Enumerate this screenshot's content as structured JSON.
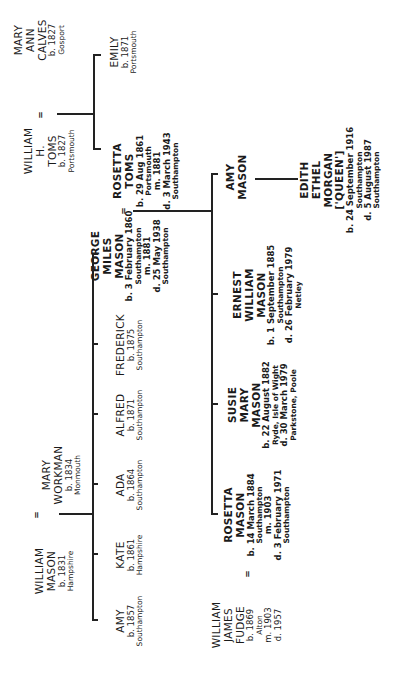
{
  "marriage_symbol": "=",
  "generation1": {
    "william_toms": {
      "name": [
        "WILLIAM",
        "H.",
        "TOMS"
      ],
      "details": [
        "b. 1827",
        "Portsmouth"
      ]
    },
    "mary_ann_calves": {
      "name": [
        "MARY",
        "ANN",
        "CALVES"
      ],
      "details": [
        "b. 1827",
        "Gosport"
      ]
    },
    "william_mason": {
      "name": [
        "WILLIAM",
        "MASON"
      ],
      "details": [
        "b. 1831",
        "Hampshire"
      ]
    },
    "mary_workman": {
      "name": [
        "MARY",
        "WORKMAN"
      ],
      "details": [
        "b. 1834",
        "Monmouth"
      ]
    }
  },
  "generation2": {
    "rosetta_toms": {
      "name": [
        "ROSETTA",
        "TOMS"
      ],
      "details": [
        "b. 29 Aug 1861",
        "Portsmouth",
        "m. 1881",
        "d. 3 March 1943",
        "Southampton"
      ]
    },
    "emily": {
      "name": [
        "EMILY"
      ],
      "details": [
        "b. 1871",
        "Portsmouth"
      ]
    },
    "george_miles_mason": {
      "name": [
        "GEORGE",
        "MILES",
        "MASON"
      ],
      "details": [
        "b. 3 February 1860",
        "Southampton",
        "m. 1881",
        "d. 25 May 1938",
        "Southampton"
      ]
    },
    "frederick": {
      "name": [
        "FREDERICK"
      ],
      "details": [
        "b. 1875",
        "Southampton"
      ]
    },
    "alfred": {
      "name": [
        "ALFRED"
      ],
      "details": [
        "b. 1871",
        "Southampton"
      ]
    },
    "ada": {
      "name": [
        "ADA"
      ],
      "details": [
        "b. 1864",
        "Southampton"
      ]
    },
    "kate": {
      "name": [
        "KATE"
      ],
      "details": [
        "b. 1861",
        "Hampshire"
      ]
    },
    "amy": {
      "name": [
        "AMY"
      ],
      "details": [
        "b. 1857",
        "Southampton"
      ]
    }
  },
  "generation3": {
    "amy_mason": {
      "name": [
        "AMY",
        "MASON"
      ],
      "details": []
    },
    "ernest_william_mason": {
      "name": [
        "ERNEST",
        "WILLIAM",
        "MASON"
      ],
      "details": [
        "b. 1 September 1885",
        "Southampton",
        "d. 26 February 1979",
        "Netley"
      ]
    },
    "susie_mary_mason": {
      "name": [
        "SUSIE",
        "MARY",
        "MASON"
      ],
      "details": [
        "b. 22 August 1882",
        "Ryde, Isle of Wight",
        "d. 30 March 1979",
        "Parkstone, Poole"
      ]
    },
    "rosetta_mason": {
      "name": [
        "ROSETTA",
        "MASON"
      ],
      "details": [
        "b. 14 March 1884",
        "Southampton",
        "m. 1903",
        "d. 3 February 1971",
        "Southampton"
      ]
    },
    "william_james_fudge": {
      "name": [
        "WILLIAM",
        "JAMES",
        "FUDGE"
      ],
      "details": [
        "b. 1869",
        "Alton",
        "m. 1903",
        "d. 1957"
      ]
    }
  },
  "generation4": {
    "edith_ethel_morgan": {
      "name": [
        "EDITH",
        "ETHEL",
        "MORGAN",
        "['QUEEN']"
      ],
      "details": [
        "b. 24 September 1916",
        "Southampton",
        "d. 5 August 1987",
        "Southampton"
      ]
    }
  }
}
